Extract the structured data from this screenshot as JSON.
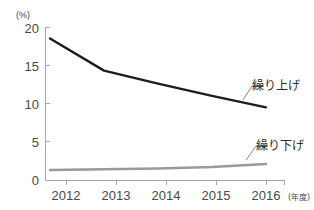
{
  "chart_data": {
    "type": "line",
    "title": "",
    "xlabel": "年度",
    "ylabel": "(%)",
    "unit_label": "(%)",
    "x_axis_note": "(年度)",
    "categories": [
      "2012",
      "2013",
      "2014",
      "2015",
      "2016"
    ],
    "x": [
      2012,
      2013,
      2014,
      2015,
      2016
    ],
    "xlim": [
      2012,
      2016
    ],
    "ylim": [
      0,
      20
    ],
    "yticks": [
      0,
      5,
      10,
      15,
      20
    ],
    "ytick_labels": [
      "0",
      "5",
      "10",
      "15",
      "20"
    ],
    "grid": false,
    "legend_position": "inline-right",
    "series": [
      {
        "name": "繰り上げ",
        "label": "繰り上げ",
        "color": "#1d1d1d",
        "values": [
          18.5,
          14.3,
          12.6,
          11.0,
          9.5
        ]
      },
      {
        "name": "繰り下げ",
        "label": "繰り下げ",
        "color": "#9a9a9a",
        "values": [
          1.3,
          1.4,
          1.5,
          1.7,
          2.1
        ]
      }
    ],
    "annotations": [
      {
        "text": "繰り上げ",
        "series": "繰り上げ"
      },
      {
        "text": "繰り下げ",
        "series": "繰り下げ"
      }
    ]
  },
  "axis": {
    "axis_color": "#9a9a9a",
    "tick_color": "#9a9a9a"
  }
}
